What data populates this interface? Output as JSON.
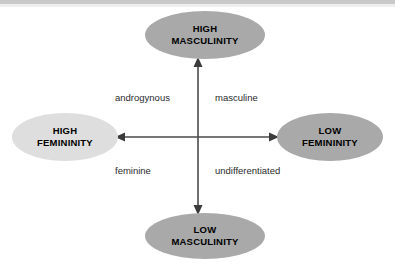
{
  "diagram": {
    "background_color": "#ffffff",
    "top_band_color": "#c9c9c9",
    "axis_color": "#4a4a4a",
    "nodes": [
      {
        "id": "high-masculinity",
        "line1": "HIGH",
        "line2": "MASCULINITY",
        "position": "top",
        "fill": "#a9a9a9",
        "text_color": "#000000"
      },
      {
        "id": "high-femininity",
        "line1": "HIGH",
        "line2": "FEMININITY",
        "position": "left",
        "fill": "#dedede",
        "text_color": "#000000"
      },
      {
        "id": "low-femininity",
        "line1": "LOW",
        "line2": "FEMININITY",
        "position": "right",
        "fill": "#a9a9a9",
        "text_color": "#000000"
      },
      {
        "id": "low-masculinity",
        "line1": "LOW",
        "line2": "MASCULINITY",
        "position": "bottom",
        "fill": "#a9a9a9",
        "text_color": "#000000"
      }
    ],
    "quadrant_labels": [
      {
        "id": "androgynous",
        "text": "androgynous",
        "quadrant": "upper-left"
      },
      {
        "id": "masculine",
        "text": "masculine",
        "quadrant": "upper-right"
      },
      {
        "id": "feminine",
        "text": "feminine",
        "quadrant": "lower-left"
      },
      {
        "id": "undifferentiated",
        "text": "undifferentiated",
        "quadrant": "lower-right"
      }
    ],
    "axes": {
      "center_x": 198,
      "center_y": 137,
      "vertical_top": 60,
      "vertical_bottom": 214,
      "horizontal_left": 117,
      "horizontal_right": 277,
      "arrow_heads": [
        "up",
        "down",
        "left",
        "right"
      ]
    }
  }
}
